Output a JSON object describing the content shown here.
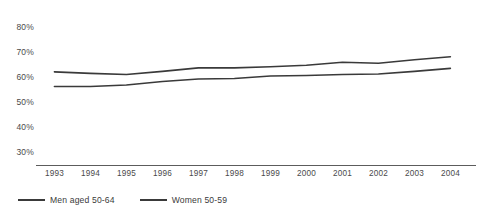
{
  "chart_data": {
    "type": "line",
    "title": "",
    "subtitle": "",
    "xlabel": "",
    "ylabel": "",
    "x": [
      1993,
      1994,
      1995,
      1996,
      1997,
      1998,
      1999,
      2000,
      2001,
      2002,
      2003,
      2004
    ],
    "categories": [
      "1993",
      "1994",
      "1995",
      "1996",
      "1997",
      "1998",
      "1999",
      "2000",
      "2001",
      "2002",
      "2003",
      "2004"
    ],
    "series": [
      {
        "name": "Men aged 50-64",
        "color": "#3a3a3a",
        "values": [
          62.0,
          61.4,
          61.0,
          62.2,
          63.6,
          63.6,
          64.0,
          64.6,
          65.8,
          65.4,
          66.8,
          68.0
        ]
      },
      {
        "name": "Women 50-59",
        "color": "#3a3a3a",
        "values": [
          56.2,
          56.2,
          56.8,
          58.2,
          59.2,
          59.4,
          60.4,
          60.6,
          61.0,
          61.2,
          62.2,
          63.4
        ]
      }
    ],
    "ylim": [
      25,
      85
    ],
    "yticks": [
      80,
      70,
      60,
      50,
      40,
      30
    ],
    "ytick_labels": [
      "80%",
      "70%",
      "60%",
      "50%",
      "40%",
      "30%"
    ],
    "ytick_suffix": "%",
    "xlim": [
      1992.6,
      2004.6
    ],
    "grid": false,
    "legend_position": "bottom-left",
    "legend": [
      "Men aged 50-64",
      "Women 50-59"
    ]
  },
  "axis": {
    "line_color": "#5c5c5c"
  }
}
